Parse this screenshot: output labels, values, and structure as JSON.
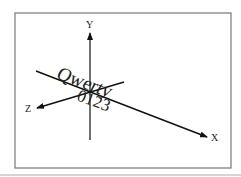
{
  "diagram": {
    "type": "3d-axes",
    "axes": {
      "x_label": "X",
      "y_label": "Y",
      "z_label": "Z"
    },
    "texts": {
      "word": "Qwerty",
      "digits": "0123"
    },
    "colors": {
      "line": "#111111",
      "frame": "#777777",
      "baseline": "#aaaaaa"
    }
  }
}
